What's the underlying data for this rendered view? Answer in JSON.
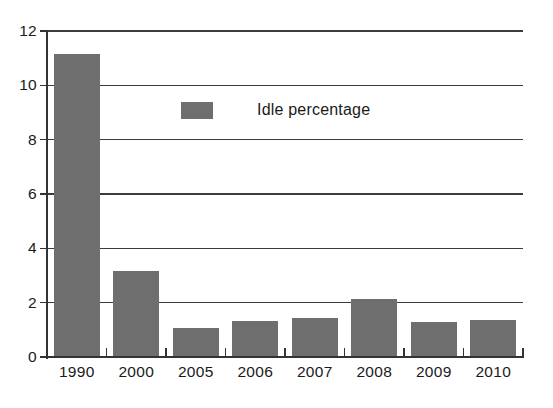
{
  "chart_data": {
    "type": "bar",
    "title": "",
    "subtitle": "",
    "xlabel": "",
    "ylabel": "",
    "categories": [
      "1990",
      "2000",
      "2005",
      "2006",
      "2007",
      "2008",
      "2009",
      "2010"
    ],
    "series": [
      {
        "name": "Idle percentage",
        "color": "#6e6e6e",
        "values": [
          11.15,
          3.15,
          1.05,
          1.32,
          1.45,
          2.15,
          1.3,
          1.35
        ]
      }
    ],
    "ylim": [
      0,
      12
    ],
    "yticks": [
      0,
      2,
      4,
      6,
      8,
      10,
      12
    ],
    "ytick_labels": [
      "0",
      "2",
      "4",
      "6",
      "8",
      "10",
      "12"
    ],
    "grid": true,
    "grid_axis": "y",
    "legend": {
      "position": "inside-upper-center",
      "entries": [
        {
          "label": "Idle percentage",
          "color": "#6e6e6e"
        }
      ]
    }
  },
  "colors": {
    "bar": "#6e6e6e",
    "axis": "#333333",
    "gridline": "#3c3c3c",
    "text": "#1a1a1a",
    "background": "#ffffff"
  }
}
